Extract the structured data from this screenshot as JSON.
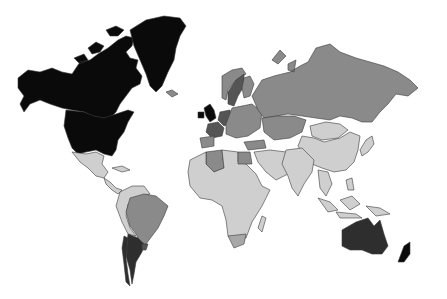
{
  "map": {
    "type": "choropleth",
    "projection": "world",
    "background": "#ffffff",
    "border_color": "#3a3a3a",
    "legend": [],
    "shade_levels": {
      "black": "#0a0a0a",
      "very_dark": "#2e2e2e",
      "dark": "#555555",
      "medium": "#8a8a8a",
      "medium_light": "#a8a8a8",
      "light": "#cfcfcf"
    },
    "regions": [
      {
        "name": "Canada",
        "shade": "black",
        "fill": "#0a0a0a"
      },
      {
        "name": "United States",
        "shade": "black",
        "fill": "#0a0a0a"
      },
      {
        "name": "Greenland",
        "shade": "black",
        "fill": "#0a0a0a"
      },
      {
        "name": "Iceland",
        "shade": "medium",
        "fill": "#8a8a8a"
      },
      {
        "name": "Mexico",
        "shade": "light",
        "fill": "#cfcfcf"
      },
      {
        "name": "Central America & Caribbean",
        "shade": "light",
        "fill": "#cfcfcf"
      },
      {
        "name": "Brazil",
        "shade": "medium",
        "fill": "#8a8a8a"
      },
      {
        "name": "Northern South America",
        "shade": "light",
        "fill": "#cfcfcf"
      },
      {
        "name": "Argentina",
        "shade": "very_dark",
        "fill": "#2e2e2e"
      },
      {
        "name": "Chile",
        "shade": "very_dark",
        "fill": "#2e2e2e"
      },
      {
        "name": "Uruguay",
        "shade": "dark",
        "fill": "#555555"
      },
      {
        "name": "United Kingdom",
        "shade": "black",
        "fill": "#0a0a0a"
      },
      {
        "name": "Ireland",
        "shade": "black",
        "fill": "#0a0a0a"
      },
      {
        "name": "France",
        "shade": "dark",
        "fill": "#555555"
      },
      {
        "name": "Germany",
        "shade": "dark",
        "fill": "#555555"
      },
      {
        "name": "Sweden",
        "shade": "dark",
        "fill": "#555555"
      },
      {
        "name": "Norway",
        "shade": "medium",
        "fill": "#8a8a8a"
      },
      {
        "name": "Finland",
        "shade": "medium",
        "fill": "#8a8a8a"
      },
      {
        "name": "Spain",
        "shade": "medium",
        "fill": "#8a8a8a"
      },
      {
        "name": "Eastern Europe",
        "shade": "medium",
        "fill": "#8a8a8a"
      },
      {
        "name": "Russia",
        "shade": "medium",
        "fill": "#8a8a8a"
      },
      {
        "name": "Kazakhstan & Central Asia",
        "shade": "medium",
        "fill": "#8a8a8a"
      },
      {
        "name": "Mongolia",
        "shade": "light",
        "fill": "#cfcfcf"
      },
      {
        "name": "China",
        "shade": "light",
        "fill": "#cfcfcf"
      },
      {
        "name": "Japan",
        "shade": "light",
        "fill": "#cfcfcf"
      },
      {
        "name": "India & South Asia",
        "shade": "light",
        "fill": "#cfcfcf"
      },
      {
        "name": "Middle East",
        "shade": "light",
        "fill": "#cfcfcf"
      },
      {
        "name": "Turkey",
        "shade": "medium",
        "fill": "#8a8a8a"
      },
      {
        "name": "Algeria",
        "shade": "medium",
        "fill": "#8a8a8a"
      },
      {
        "name": "Egypt",
        "shade": "medium",
        "fill": "#8a8a8a"
      },
      {
        "name": "Africa (rest)",
        "shade": "light",
        "fill": "#cfcfcf"
      },
      {
        "name": "South Africa",
        "shade": "medium_light",
        "fill": "#a8a8a8"
      },
      {
        "name": "Madagascar",
        "shade": "light",
        "fill": "#cfcfcf"
      },
      {
        "name": "Southeast Asia & Indonesia",
        "shade": "light",
        "fill": "#cfcfcf"
      },
      {
        "name": "Papua New Guinea",
        "shade": "light",
        "fill": "#cfcfcf"
      },
      {
        "name": "Australia",
        "shade": "very_dark",
        "fill": "#2e2e2e"
      },
      {
        "name": "New Zealand",
        "shade": "black",
        "fill": "#0a0a0a"
      }
    ]
  }
}
